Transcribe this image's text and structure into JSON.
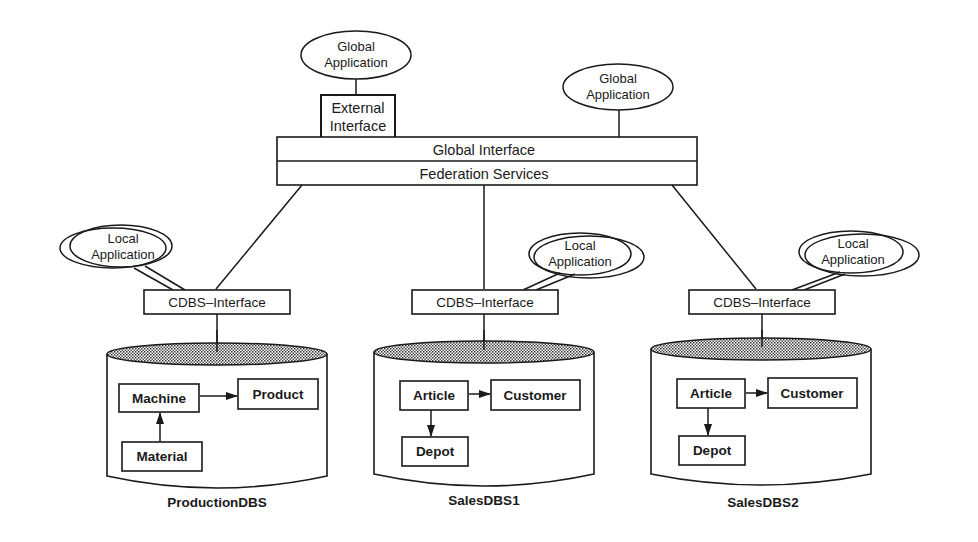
{
  "diagram": {
    "global_layer": {
      "global_applications": [
        {
          "label_line1": "Global",
          "label_line2": "Application"
        },
        {
          "label_line1": "Global",
          "label_line2": "Application"
        }
      ],
      "external_interface": {
        "label_line1": "External",
        "label_line2": "Interface"
      },
      "global_interface": "Global Interface",
      "federation_services": "Federation Services"
    },
    "components": [
      {
        "local_application": {
          "label_line1": "Local",
          "label_line2": "Application",
          "position": "left"
        },
        "cdbs_interface": "CDBS–Interface",
        "database": {
          "name": "ProductionDBS",
          "entities": [
            "Machine",
            "Product",
            "Material"
          ],
          "relations": [
            {
              "from": "Machine",
              "to": "Product"
            },
            {
              "from": "Material",
              "to": "Machine"
            }
          ]
        }
      },
      {
        "local_application": {
          "label_line1": "Local",
          "label_line2": "Application",
          "position": "right"
        },
        "cdbs_interface": "CDBS–Interface",
        "database": {
          "name": "SalesDBS1",
          "entities": [
            "Article",
            "Customer",
            "Depot"
          ],
          "relations": [
            {
              "from": "Article",
              "to": "Customer"
            },
            {
              "from": "Article",
              "to": "Depot"
            }
          ]
        }
      },
      {
        "local_application": {
          "label_line1": "Local",
          "label_line2": "Application",
          "position": "right"
        },
        "cdbs_interface": "CDBS–Interface",
        "database": {
          "name": "SalesDBS2",
          "entities": [
            "Article",
            "Customer",
            "Depot"
          ],
          "relations": [
            {
              "from": "Article",
              "to": "Customer"
            },
            {
              "from": "Article",
              "to": "Depot"
            }
          ]
        }
      }
    ]
  },
  "colors": {
    "line": "#1a1a1a",
    "background": "#ffffff",
    "cylinder_top_fill": "#bdbdbd"
  }
}
